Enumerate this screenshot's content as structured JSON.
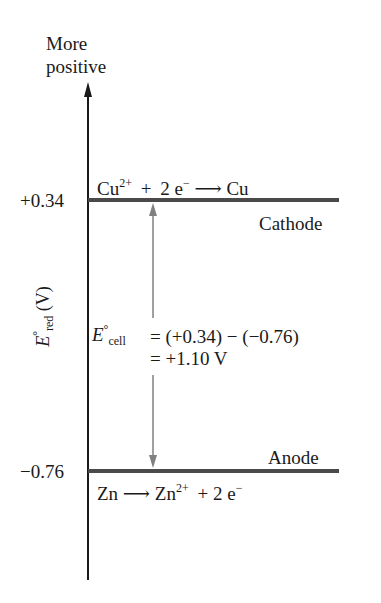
{
  "diagram": {
    "axis": {
      "top_label_line1": "More",
      "top_label_line2": "positive",
      "ylabel_symbol": "E",
      "ylabel_degree": "°",
      "ylabel_subscript": "red",
      "ylabel_unit": " (V)",
      "ticks": [
        {
          "label": "+0.34",
          "value": 0.34
        },
        {
          "label": "−0.76",
          "value": -0.76
        }
      ]
    },
    "cathode": {
      "label": "Cathode",
      "reaction": {
        "reactant": "Cu",
        "reactant_charge": "2+",
        "plus": "+",
        "electrons": "2 e",
        "electron_charge": "−",
        "arrow": "⟶",
        "product": "Cu"
      },
      "potential": 0.34
    },
    "anode": {
      "label": "Anode",
      "reaction": {
        "reactant": "Zn",
        "arrow": "⟶",
        "product": "Zn",
        "product_charge": "2+",
        "plus": "+",
        "electrons": "2 e",
        "electron_charge": "−"
      },
      "potential": -0.76
    },
    "cell_equation": {
      "symbol": "E",
      "degree": "°",
      "subscript": "cell",
      "line1": "= (+0.34) − (−0.76)",
      "line2": "= +1.10 V"
    },
    "colors": {
      "axis": "#1a1a1a",
      "level_line": "#4a4a4a",
      "double_arrow": "#808080",
      "text": "#1a1a1a"
    }
  }
}
